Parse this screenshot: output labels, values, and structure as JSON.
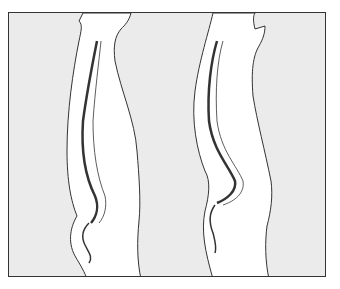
{
  "figure": {
    "panels": [
      {
        "id": "left",
        "label": "normal-posture-spine"
      },
      {
        "id": "right",
        "label": "exaggerated-curve-spine"
      }
    ],
    "colors": {
      "background": "#ebebeb",
      "body": "#ffffff",
      "line": "#333333",
      "frame": "#333333"
    }
  }
}
